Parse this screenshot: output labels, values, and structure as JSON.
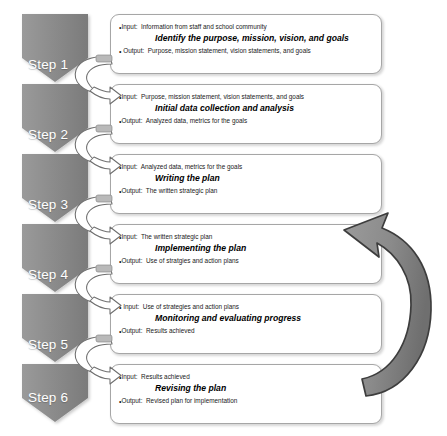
{
  "diagram": {
    "type": "vertical-process-flow",
    "colors": {
      "chevron_fill": "#8c8c8c",
      "chevron_fill_dark": "#7d7d7d",
      "box_border": "#a6a6a6",
      "box_fill": "#ffffff",
      "connector_stroke": "#6e6e6e",
      "connector_fill": "#ffffff",
      "feedback_arrow_fill": "#8a8a8a",
      "feedback_arrow_stroke": "#3d3d3d",
      "step_label_text": "#ffffff",
      "body_text": "#1a1a1a"
    }
  },
  "steps": [
    {
      "id": "step-1",
      "label": "Step 1",
      "input_label": "Input:",
      "input_text": "Information from staff and school community",
      "title": "Identify the purpose, mission, vision, and goals",
      "output_label": "Output:",
      "output_text": "Purpose, mission statement, vision statements, and goals"
    },
    {
      "id": "step-2",
      "label": "Step 2",
      "input_label": "Input:",
      "input_text": "Purpose, mission statement, vision statements, and goals",
      "title": "Initial data collection and analysis",
      "output_label": "Output:",
      "output_text": "Analyzed data, metrics for the goals"
    },
    {
      "id": "step-3",
      "label": "Step 3",
      "input_label": "Input:",
      "input_text": "Analyzed data, metrics for the goals",
      "title": "Writing the plan",
      "output_label": "Output:",
      "output_text": "The written strategic plan"
    },
    {
      "id": "step-4",
      "label": "Step 4",
      "input_label": "Input:",
      "input_text": "The written strategic plan",
      "title": "Implementing the plan",
      "output_label": "Output:",
      "output_text": "Use of stratgies and action plans"
    },
    {
      "id": "step-5",
      "label": "Input:",
      "label_text": "Step 5",
      "input_label": "Input:",
      "input_text": "Use of strategies and action plans",
      "title": "Monitoring and evaluating progress",
      "output_label": "Output:",
      "output_text": "Results achieved"
    },
    {
      "id": "step-6",
      "label": "Step 6",
      "input_label": "Input:",
      "input_text": "Results achieved",
      "title": "Revising the plan",
      "output_label": "Output:",
      "output_text": "Revised plan for implementation"
    }
  ],
  "step_labels": [
    "Step 1",
    "Step 2",
    "Step 3",
    "Step 4",
    "Step 5",
    "Step 6"
  ],
  "connectors": {
    "between_steps_icon": "curved-loop-arrow",
    "count": 5,
    "feedback_icon": "curved-feedback-arrow",
    "feedback_from": "Step 6",
    "feedback_to": "Step 4"
  }
}
